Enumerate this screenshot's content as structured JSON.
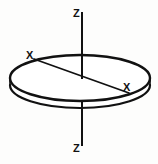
{
  "figure": {
    "background_color": "#fdfdfc",
    "stroke_color": "#111111",
    "labels": {
      "z_top": "Z",
      "z_bottom": "Z",
      "x_left": "X",
      "x_right": "X"
    },
    "geometry": {
      "disc": {
        "center_x": 80,
        "center_y": 78,
        "radius_x": 70,
        "radius_y": 23,
        "thickness": 8
      },
      "z_axis": {
        "x": 82,
        "y_top": 12,
        "y_bottom": 146
      },
      "x_axis": {
        "x1": 34,
        "y1": 59,
        "x2": 129,
        "y2": 93
      }
    }
  }
}
